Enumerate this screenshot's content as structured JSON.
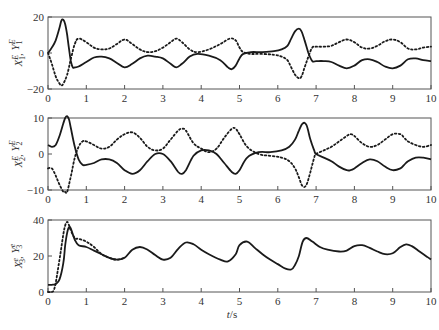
{
  "chart_data": [
    {
      "type": "line",
      "title": "",
      "xlabel": "",
      "ylabel": "X1^E, Y1^E",
      "ylabel_parts": {
        "a": "X",
        "a_sub": "1",
        "a_sup": "E",
        "b": "Y",
        "b_sub": "1",
        "b_sup": "E"
      },
      "xlim": [
        0,
        10
      ],
      "ylim": [
        -20,
        20
      ],
      "xticks": [
        0,
        1,
        2,
        3,
        4,
        5,
        6,
        7,
        8,
        9,
        10
      ],
      "yticks": [
        -20,
        0,
        20
      ],
      "grid": false,
      "series": [
        {
          "name": "X1^E",
          "style": "solid",
          "x": [
            0,
            0.1,
            0.2,
            0.3,
            0.35,
            0.4,
            0.45,
            0.5,
            0.55,
            0.6,
            0.65,
            0.7,
            0.8,
            1.0,
            1.2,
            1.4,
            1.6,
            1.8,
            2.0,
            2.2,
            2.4,
            2.6,
            2.8,
            3.0,
            3.2,
            3.35,
            3.5,
            3.7,
            3.9,
            4.2,
            4.5,
            4.7,
            4.8,
            4.9,
            5.0,
            5.1,
            5.3,
            5.6,
            5.9,
            6.1,
            6.25,
            6.35,
            6.45,
            6.55,
            6.62,
            6.7,
            6.8,
            6.9,
            7.0,
            7.2,
            7.4,
            7.6,
            7.8,
            8.0,
            8.2,
            8.4,
            8.6,
            8.8,
            9.0,
            9.2,
            9.4,
            9.6,
            9.8,
            10.0
          ],
          "values": [
            0,
            3,
            7,
            14,
            18,
            18.5,
            16,
            10,
            2,
            -5,
            -8,
            -8,
            -7.5,
            -5,
            -2.5,
            -2,
            -3,
            -5.5,
            -8,
            -6,
            -3,
            -1.5,
            -2,
            -3,
            -6,
            -8,
            -6,
            -2,
            -0.5,
            -1.5,
            -4,
            -8,
            -9,
            -7,
            -3,
            -0.5,
            0.5,
            0.5,
            1,
            2,
            4,
            8,
            12,
            13.5,
            12,
            7,
            0,
            -4.5,
            -4.5,
            -4.5,
            -5,
            -7,
            -8.5,
            -7,
            -4,
            -3.5,
            -5,
            -7.5,
            -8.5,
            -7,
            -3.5,
            -3,
            -4,
            -4.5
          ]
        },
        {
          "name": "Y1^E",
          "style": "dotted",
          "x": [
            0,
            0.1,
            0.2,
            0.3,
            0.35,
            0.4,
            0.5,
            0.6,
            0.7,
            0.8,
            1.0,
            1.2,
            1.4,
            1.6,
            1.8,
            2.0,
            2.2,
            2.4,
            2.6,
            2.8,
            3.0,
            3.2,
            3.35,
            3.5,
            3.7,
            3.9,
            4.2,
            4.5,
            4.75,
            4.9,
            5.0,
            5.1,
            5.3,
            5.6,
            5.9,
            6.1,
            6.25,
            6.35,
            6.45,
            6.55,
            6.62,
            6.7,
            6.8,
            6.9,
            7.0,
            7.2,
            7.4,
            7.6,
            7.8,
            8.0,
            8.2,
            8.4,
            8.6,
            8.8,
            9.0,
            9.2,
            9.4,
            9.6,
            9.8,
            10.0
          ],
          "values": [
            0,
            -6,
            -13,
            -17,
            -18,
            -17,
            -12,
            -3,
            5,
            8,
            6,
            3,
            2,
            2.5,
            5,
            7.5,
            5,
            2,
            0.5,
            1,
            3,
            6,
            8,
            6,
            2,
            0.5,
            2,
            5,
            8,
            7,
            3,
            0.5,
            -0.5,
            -0.5,
            -1,
            -2,
            -4,
            -8,
            -12,
            -14,
            -13,
            -8,
            -2,
            3,
            3.5,
            3.5,
            4,
            6,
            7.5,
            6,
            3,
            2.5,
            4,
            6.5,
            7.5,
            6,
            2.5,
            2,
            3,
            3.5
          ]
        }
      ]
    },
    {
      "type": "line",
      "title": "",
      "xlabel": "",
      "ylabel": "X2^E, Y2^E",
      "ylabel_parts": {
        "a": "X",
        "a_sub": "2",
        "a_sup": "E",
        "b": "Y",
        "b_sub": "2",
        "b_sup": "E"
      },
      "xlim": [
        0,
        10
      ],
      "ylim": [
        -10,
        10
      ],
      "xticks": [
        0,
        1,
        2,
        3,
        4,
        5,
        6,
        7,
        8,
        9,
        10
      ],
      "yticks": [
        -10,
        0,
        10
      ],
      "grid": false,
      "series": [
        {
          "name": "X2^E",
          "style": "solid",
          "x": [
            0,
            0.1,
            0.2,
            0.3,
            0.4,
            0.45,
            0.5,
            0.55,
            0.6,
            0.7,
            0.8,
            0.9,
            1.0,
            1.2,
            1.4,
            1.6,
            1.8,
            2.0,
            2.2,
            2.4,
            2.6,
            2.8,
            3.0,
            3.2,
            3.4,
            3.5,
            3.6,
            3.8,
            4.0,
            4.2,
            4.4,
            4.6,
            4.8,
            4.9,
            5.0,
            5.2,
            5.5,
            5.8,
            6.1,
            6.3,
            6.45,
            6.55,
            6.65,
            6.75,
            6.85,
            6.95,
            7.0,
            7.2,
            7.4,
            7.6,
            7.8,
            7.9,
            8.0,
            8.2,
            8.4,
            8.6,
            8.8,
            9.0,
            9.2,
            9.3,
            9.4,
            9.6,
            9.8,
            10.0
          ],
          "values": [
            2.5,
            2,
            2.5,
            5,
            8.5,
            10,
            10.5,
            9.5,
            7,
            2,
            -1.5,
            -3,
            -3,
            -2.5,
            -1.5,
            -1.5,
            -2.5,
            -4.5,
            -5.5,
            -4.5,
            -2,
            0,
            0,
            -2,
            -5,
            -5.5,
            -4.5,
            -0.5,
            1,
            1,
            0,
            -2.5,
            -5,
            -5.5,
            -4.5,
            -1,
            0.5,
            0.5,
            1,
            2,
            4,
            6.5,
            8.5,
            8,
            4,
            1,
            0,
            -1,
            -2,
            -3.5,
            -4.5,
            -4.5,
            -4,
            -2.5,
            -1.5,
            -2,
            -3.5,
            -4.5,
            -4,
            -3,
            -2,
            -1,
            -1,
            -1.5
          ]
        },
        {
          "name": "Y2^E",
          "style": "dotted",
          "x": [
            0,
            0.1,
            0.2,
            0.3,
            0.4,
            0.45,
            0.5,
            0.6,
            0.7,
            0.8,
            0.9,
            1.0,
            1.2,
            1.4,
            1.6,
            1.8,
            2.0,
            2.2,
            2.4,
            2.6,
            2.8,
            3.0,
            3.2,
            3.4,
            3.5,
            3.6,
            3.8,
            4.0,
            4.2,
            4.4,
            4.6,
            4.8,
            4.9,
            5.0,
            5.2,
            5.5,
            5.8,
            6.1,
            6.3,
            6.45,
            6.55,
            6.65,
            6.75,
            6.85,
            6.95,
            7.0,
            7.2,
            7.4,
            7.6,
            7.8,
            7.9,
            8.0,
            8.2,
            8.4,
            8.6,
            8.8,
            9.0,
            9.2,
            9.3,
            9.4,
            9.6,
            9.8,
            10.0
          ],
          "values": [
            -4,
            -4,
            -6,
            -8.5,
            -10.5,
            -11,
            -10.5,
            -6,
            -1,
            2,
            3.5,
            3.5,
            2.5,
            1.5,
            2,
            4,
            5.5,
            6,
            4.5,
            2,
            1,
            1.5,
            4,
            6.5,
            7,
            6.5,
            3,
            1.5,
            0.5,
            1.5,
            4.5,
            7,
            7,
            5.5,
            2,
            0,
            -0.5,
            -1,
            -2,
            -4,
            -6.5,
            -9,
            -8.5,
            -5,
            -1,
            0,
            1,
            2,
            3.5,
            5,
            5.5,
            5,
            3,
            2,
            2.5,
            4,
            5.5,
            5.5,
            4.5,
            3.5,
            2.5,
            2,
            2.5
          ]
        }
      ]
    },
    {
      "type": "line",
      "title": "",
      "xlabel": "t/s",
      "ylabel": "X3^e, Y3^e",
      "ylabel_parts": {
        "a": "X",
        "a_sub": "3",
        "a_sup": "e",
        "b": "Y",
        "b_sub": "3",
        "b_sup": "e"
      },
      "xlim": [
        0,
        10
      ],
      "ylim": [
        0,
        40
      ],
      "xticks": [
        0,
        1,
        2,
        3,
        4,
        5,
        6,
        7,
        8,
        9,
        10
      ],
      "yticks": [
        0,
        20,
        40
      ],
      "grid": false,
      "series": [
        {
          "name": "X3^e",
          "style": "solid",
          "x": [
            0,
            0.1,
            0.2,
            0.3,
            0.4,
            0.45,
            0.5,
            0.55,
            0.6,
            0.7,
            0.8,
            1.0,
            1.2,
            1.4,
            1.6,
            1.8,
            2.0,
            2.2,
            2.4,
            2.6,
            2.8,
            3.0,
            3.2,
            3.4,
            3.6,
            3.8,
            4.0,
            4.2,
            4.5,
            4.7,
            4.9,
            5.0,
            5.2,
            5.4,
            5.6,
            5.8,
            6.0,
            6.2,
            6.35,
            6.45,
            6.55,
            6.65,
            6.75,
            6.9,
            7.1,
            7.3,
            7.6,
            7.8,
            8.0,
            8.2,
            8.4,
            8.6,
            8.8,
            9.0,
            9.2,
            9.35,
            9.5,
            9.7,
            9.9,
            10.0
          ],
          "values": [
            4,
            4,
            4.5,
            7,
            16,
            26,
            33,
            36,
            35,
            29,
            26,
            25,
            23,
            21,
            19,
            18,
            19,
            23.5,
            25,
            23.5,
            20.5,
            18,
            19,
            24,
            27.5,
            26.5,
            23.5,
            21,
            18,
            17,
            21,
            26,
            28,
            24.5,
            21,
            18,
            15.5,
            13,
            12.5,
            15,
            20,
            28,
            30,
            28,
            25,
            23.5,
            22.5,
            23,
            25.5,
            26,
            24.5,
            22.5,
            21,
            21.5,
            25,
            26.5,
            25.5,
            22.5,
            19.5,
            18
          ]
        },
        {
          "name": "Y3^e",
          "style": "dotted",
          "x": [
            0,
            0.1,
            0.15,
            0.2,
            0.3,
            0.4,
            0.45,
            0.5,
            0.55,
            0.6,
            0.7,
            0.8,
            1.0,
            1.2,
            1.4,
            1.6,
            1.8,
            2.0
          ],
          "values": [
            0,
            0,
            1,
            5,
            18,
            32,
            37,
            39,
            37,
            34,
            30,
            29.5,
            28,
            25,
            21,
            19,
            18,
            19
          ]
        }
      ]
    }
  ],
  "axes": {
    "x_tick_labels": [
      "0",
      "1",
      "2",
      "3",
      "4",
      "5",
      "6",
      "7",
      "8",
      "9",
      "10"
    ],
    "xlabel_t": "t",
    "xlabel_unit": "/s",
    "panel1_yticks": [
      "20",
      "0",
      "−20"
    ],
    "panel2_yticks": [
      "10",
      "0",
      "−10"
    ],
    "panel3_yticks": [
      "40",
      "20",
      "0"
    ]
  }
}
